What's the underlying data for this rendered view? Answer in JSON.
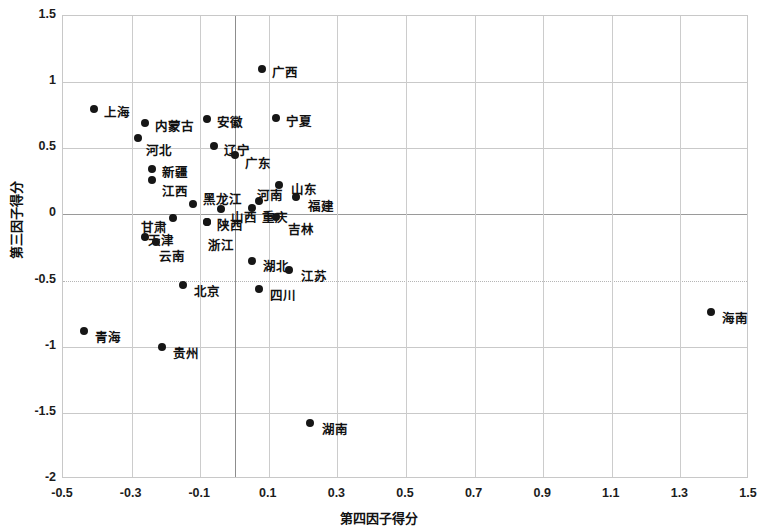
{
  "chart_data": {
    "type": "scatter",
    "title": "",
    "xlabel": "第四因子得分",
    "ylabel": "第三因子得分",
    "xlim": [
      -0.5,
      1.5
    ],
    "ylim": [
      -2,
      1.5
    ],
    "xticks": [
      "-0.5",
      "-0.3",
      "-0.1",
      "0.1",
      "0.3",
      "0.5",
      "0.7",
      "0.9",
      "1.1",
      "1.3",
      "1.5"
    ],
    "xtick_values": [
      -0.5,
      -0.3,
      -0.1,
      0.1,
      0.3,
      0.5,
      0.7,
      0.9,
      1.1,
      1.3,
      1.5
    ],
    "yticks": [
      "1.5",
      "1",
      "0.5",
      "0",
      "-0.5",
      "-1",
      "-1.5",
      "-2"
    ],
    "ytick_values": [
      1.5,
      1,
      0.5,
      0,
      -0.5,
      -1,
      -1.5,
      -2
    ],
    "grid": true,
    "legend": "none",
    "marker_color": "#161616",
    "grid_color": "#c9c9c9",
    "points": [
      {
        "label": "广西",
        "x": 0.08,
        "y": 1.1,
        "lx": 10,
        "ly": -7
      },
      {
        "label": "上海",
        "x": -0.41,
        "y": 0.8,
        "lx": 10,
        "ly": -7
      },
      {
        "label": "内蒙古",
        "x": -0.26,
        "y": 0.69,
        "lx": 10,
        "ly": -7
      },
      {
        "label": "安徽",
        "x": -0.08,
        "y": 0.72,
        "lx": 10,
        "ly": -7
      },
      {
        "label": "宁夏",
        "x": 0.12,
        "y": 0.73,
        "lx": 10,
        "ly": -7
      },
      {
        "label": "河北",
        "x": -0.28,
        "y": 0.58,
        "lx": 8,
        "ly": 2
      },
      {
        "label": "辽宁",
        "x": -0.06,
        "y": 0.52,
        "lx": 10,
        "ly": -6
      },
      {
        "label": "广东",
        "x": 0.0,
        "y": 0.45,
        "lx": 10,
        "ly": -2
      },
      {
        "label": "新疆",
        "x": -0.24,
        "y": 0.34,
        "lx": 10,
        "ly": -7
      },
      {
        "label": "江西",
        "x": -0.24,
        "y": 0.26,
        "lx": 10,
        "ly": 1
      },
      {
        "label": "山东",
        "x": 0.13,
        "y": 0.22,
        "lx": 12,
        "ly": -6
      },
      {
        "label": "福建",
        "x": 0.18,
        "y": 0.13,
        "lx": 12,
        "ly": -1
      },
      {
        "label": "黑龙江",
        "x": -0.12,
        "y": 0.08,
        "lx": 0,
        "ly": -15
      },
      {
        "label": "河南",
        "x": 0.07,
        "y": 0.1,
        "lx": -2,
        "ly": -16
      },
      {
        "label": "山西",
        "x": -0.04,
        "y": 0.04,
        "lx": 10,
        "ly": -2
      },
      {
        "label": "重庆",
        "x": 0.05,
        "y": 0.05,
        "lx": 10,
        "ly": -1
      },
      {
        "label": "甘肃",
        "x": -0.18,
        "y": -0.03,
        "lx": -32,
        "ly": -1
      },
      {
        "label": "陕西",
        "x": -0.08,
        "y": -0.06,
        "lx": 10,
        "ly": 0
      },
      {
        "label": "吉林",
        "x": 0.12,
        "y": -0.02,
        "lx": 12,
        "ly": 2
      },
      {
        "label": "浙江",
        "x": -0.08,
        "y": -0.06,
        "lx": 1,
        "ly": 13
      },
      {
        "label": "天津",
        "x": -0.26,
        "y": -0.17,
        "lx": 3,
        "ly": -7
      },
      {
        "label": "云南",
        "x": -0.23,
        "y": -0.21,
        "lx": 3,
        "ly": 4
      },
      {
        "label": "湖北",
        "x": 0.05,
        "y": -0.35,
        "lx": 11,
        "ly": -5
      },
      {
        "label": "江苏",
        "x": 0.16,
        "y": -0.42,
        "lx": 12,
        "ly": -4
      },
      {
        "label": "北京",
        "x": -0.15,
        "y": -0.53,
        "lx": 11,
        "ly": -4
      },
      {
        "label": "四川",
        "x": 0.07,
        "y": -0.56,
        "lx": 11,
        "ly": -4
      },
      {
        "label": "海南",
        "x": 1.39,
        "y": -0.74,
        "lx": 11,
        "ly": -4
      },
      {
        "label": "青海",
        "x": -0.44,
        "y": -0.88,
        "lx": 11,
        "ly": -4
      },
      {
        "label": "贵州",
        "x": -0.21,
        "y": -1.0,
        "lx": 11,
        "ly": -4
      },
      {
        "label": "湖南",
        "x": 0.22,
        "y": -1.58,
        "lx": 12,
        "ly": -4
      }
    ]
  }
}
